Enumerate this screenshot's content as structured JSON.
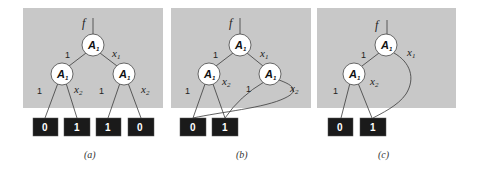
{
  "figure": {
    "panels": [
      {
        "id": "a",
        "caption": "(a)",
        "function_label": "f",
        "nodes": [
          {
            "id": "root",
            "var": "A",
            "sub": "1"
          },
          {
            "id": "left",
            "var": "A",
            "sub": "1"
          },
          {
            "id": "right",
            "var": "A",
            "sub": "1"
          }
        ],
        "terminals": [
          "0",
          "1",
          "1",
          "0"
        ],
        "edges": [
          {
            "from": "root",
            "to": "left",
            "label": "1"
          },
          {
            "from": "root",
            "to": "right",
            "label": "x",
            "label_sub": "1"
          },
          {
            "from": "left",
            "to": "t0",
            "label": "1"
          },
          {
            "from": "left",
            "to": "t1",
            "label": "x",
            "label_sub": "2"
          },
          {
            "from": "right",
            "to": "t2",
            "label": "1"
          },
          {
            "from": "right",
            "to": "t3",
            "label": "x",
            "label_sub": "2"
          }
        ]
      },
      {
        "id": "b",
        "caption": "(b)",
        "function_label": "f",
        "nodes": [
          {
            "id": "root",
            "var": "A",
            "sub": "1"
          },
          {
            "id": "left",
            "var": "A",
            "sub": "1"
          },
          {
            "id": "right",
            "var": "A",
            "sub": "1"
          }
        ],
        "terminals": [
          "0",
          "1"
        ],
        "edges": [
          {
            "from": "root",
            "to": "left",
            "label": "1"
          },
          {
            "from": "root",
            "to": "right",
            "label": "x",
            "label_sub": "1"
          },
          {
            "from": "left",
            "to": "t0",
            "label": "1"
          },
          {
            "from": "left",
            "to": "t1",
            "label": "x",
            "label_sub": "2"
          },
          {
            "from": "right",
            "to": "t1",
            "label": "1"
          },
          {
            "from": "right",
            "to": "t0",
            "label": "x",
            "label_sub": "2"
          }
        ]
      },
      {
        "id": "c",
        "caption": "(c)",
        "function_label": "f",
        "nodes": [
          {
            "id": "root",
            "var": "A",
            "sub": "1"
          },
          {
            "id": "left",
            "var": "A",
            "sub": "1"
          }
        ],
        "terminals": [
          "0",
          "1"
        ],
        "edges": [
          {
            "from": "root",
            "to": "left",
            "label": "1"
          },
          {
            "from": "root",
            "to": "t1",
            "label": "x",
            "label_sub": "1"
          },
          {
            "from": "left",
            "to": "t0",
            "label": "1"
          },
          {
            "from": "left",
            "to": "t1",
            "label": "x",
            "label_sub": "2"
          }
        ]
      }
    ]
  }
}
